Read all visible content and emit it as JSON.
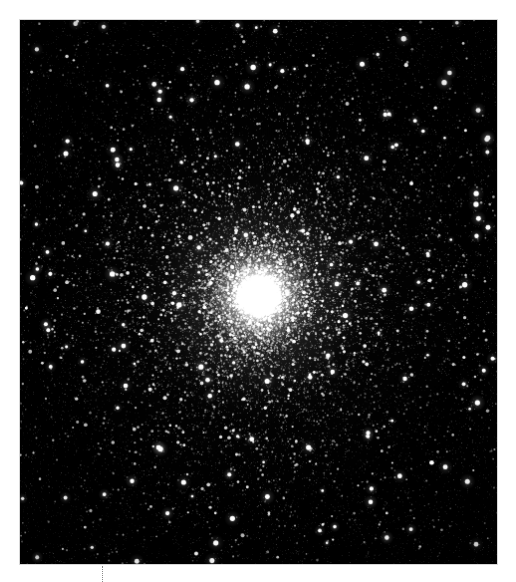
{
  "page": {
    "background_color": "#ffffff",
    "width": 516,
    "height": 582
  },
  "image_plate": {
    "name": "globular-cluster-image",
    "alt_text": "Globular star cluster",
    "background_color": "#000000",
    "border_color": "#d8d8d8",
    "x": 19,
    "y": 19,
    "width": 479,
    "height": 546
  },
  "scene": {
    "type": "astronomical-photograph",
    "subject": "globular cluster",
    "core": {
      "center_x": 240,
      "center_y": 277,
      "saturated_radius": 22,
      "bright_core_radius": 52,
      "halo_radius": 130,
      "outer_halo_radius": 235,
      "color": "#ffffff"
    },
    "field": {
      "background_color": "#000000",
      "faint_noise_count": 9000,
      "field_star_count": 1500,
      "cluster_star_count": 14000,
      "bright_star_count": 160
    },
    "random_seed": 20240517
  },
  "dotted_guide": {
    "name": "dotted-column-guide",
    "x": 102,
    "y": 566,
    "height": 16,
    "color": "#8a8a8a",
    "style": "dotted"
  }
}
